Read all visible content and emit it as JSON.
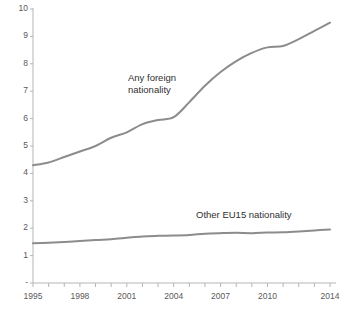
{
  "chart_data": {
    "type": "line",
    "title": "",
    "xlabel": "",
    "ylabel": "",
    "ylim": [
      0,
      10
    ],
    "xlim": [
      1995,
      2014
    ],
    "grid": false,
    "legend_position": "inline-annotations",
    "ytick_labels": [
      "-",
      "1",
      "2",
      "3",
      "4",
      "5",
      "6",
      "7",
      "8",
      "9",
      "10"
    ],
    "ytick_values": [
      0,
      1,
      2,
      3,
      4,
      5,
      6,
      7,
      8,
      9,
      10
    ],
    "xtick_labels": [
      "1995",
      "1998",
      "2001",
      "2004",
      "2007",
      "2010",
      "2014"
    ],
    "xtick_values": [
      1995,
      1998,
      2001,
      2004,
      2007,
      2010,
      2014
    ],
    "x": [
      1995,
      1996,
      1997,
      1998,
      1999,
      2000,
      2001,
      2002,
      2003,
      2004,
      2005,
      2006,
      2007,
      2008,
      2009,
      2010,
      2011,
      2012,
      2013,
      2014
    ],
    "series": [
      {
        "name": "Any foreign nationality",
        "label_text": "Any foreign\nnationality",
        "color": "#8c8c8c",
        "values": [
          4.3,
          4.4,
          4.6,
          4.8,
          5.0,
          5.3,
          5.5,
          5.8,
          5.95,
          6.05,
          6.6,
          7.2,
          7.7,
          8.1,
          8.4,
          8.6,
          8.65,
          8.9,
          9.2,
          9.5
        ]
      },
      {
        "name": "Other EU15 nationality",
        "label_text": "Other EU15 nationality",
        "color": "#8c8c8c",
        "values": [
          1.45,
          1.47,
          1.5,
          1.53,
          1.57,
          1.6,
          1.65,
          1.7,
          1.72,
          1.73,
          1.75,
          1.8,
          1.82,
          1.83,
          1.82,
          1.84,
          1.85,
          1.88,
          1.92,
          1.95
        ]
      }
    ]
  },
  "axis": {
    "line_color": "#b5b5b5",
    "tick_color": "#b5b5b5"
  }
}
